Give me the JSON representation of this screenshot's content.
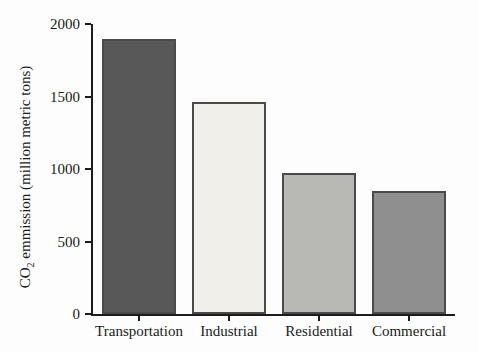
{
  "figure": {
    "background": "#fdfdfd",
    "axis_color": "#1c1c1c"
  },
  "chart_data": {
    "type": "bar",
    "title": "",
    "categories": [
      "Transportation",
      "Industrial",
      "Residential",
      "Commercial"
    ],
    "values": [
      1900,
      1460,
      970,
      850
    ],
    "bar_colors": [
      "#585858",
      "#f0efe9",
      "#b8b8b5",
      "#8f8f8f"
    ],
    "bar_border_color": "#4a4a4a",
    "xlabel": "",
    "ylabel": "CO2 emmission (million metric tons)",
    "ylabel_parts": {
      "prefix": "CO",
      "subscript": "2",
      "suffix": " emmission (million metric tons)"
    },
    "ylim": [
      0,
      2000
    ],
    "yticks": [
      "0",
      "500",
      "1000",
      "1500",
      "2000"
    ],
    "grid": false,
    "legend": null
  }
}
